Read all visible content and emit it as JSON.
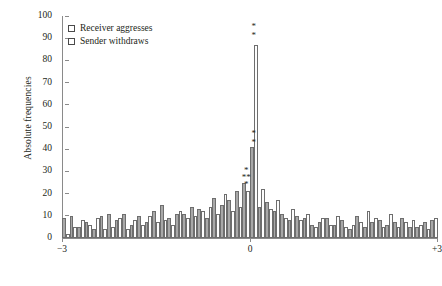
{
  "chart_data": {
    "type": "bar",
    "title": "",
    "subtitle": "",
    "xlabel": "",
    "ylabel": "Absolute frequencies",
    "ylim": [
      0,
      100
    ],
    "ytick_labels": [
      "0",
      "10",
      "20",
      "30",
      "40",
      "50",
      "60",
      "70",
      "80",
      "90",
      "100"
    ],
    "ytick_values": [
      0,
      10,
      20,
      30,
      40,
      50,
      60,
      70,
      80,
      90,
      100
    ],
    "xlim": [
      -3,
      3
    ],
    "xtick_labels": [
      "−3",
      "0",
      "+3"
    ],
    "xtick_values": [
      -3,
      0,
      3
    ],
    "grid": false,
    "legend_position": "top-left",
    "legend": [
      {
        "name": "Receiver aggresses",
        "swatch": "dark"
      },
      {
        "name": "Sender withdraws",
        "swatch": "light"
      }
    ],
    "series": [
      {
        "name": "Receiver aggresses",
        "swatch": "dark",
        "values": [
          9,
          10,
          5,
          7,
          4,
          10,
          11,
          8,
          11,
          6,
          10,
          7,
          12,
          15,
          9,
          11,
          11,
          14,
          13,
          9,
          18,
          15,
          17,
          21,
          25,
          41,
          14,
          16,
          12,
          11,
          8,
          10,
          9,
          6,
          7,
          9,
          6,
          8,
          4,
          10,
          5,
          7,
          8,
          6,
          7,
          9,
          5,
          5,
          7,
          8
        ]
      },
      {
        "name": "Sender withdraws",
        "swatch": "light",
        "values": [
          2,
          5,
          8,
          6,
          9,
          4,
          5,
          9,
          4,
          8,
          6,
          10,
          7,
          8,
          6,
          12,
          9,
          10,
          12,
          14,
          11,
          20,
          12,
          14,
          21,
          87,
          22,
          13,
          17,
          9,
          13,
          8,
          11,
          5,
          9,
          6,
          10,
          5,
          6,
          7,
          12,
          9,
          5,
          11,
          5,
          7,
          8,
          6,
          4,
          9
        ]
      }
    ],
    "annotations": [
      {
        "label": "*",
        "x_index": 24,
        "value": 30,
        "note": "significance marker above receiver bar"
      },
      {
        "label": "**",
        "x_index": 24,
        "value": 27,
        "note": "significance marker above receiver bar"
      },
      {
        "label": "*",
        "x_index": 24,
        "value": 24,
        "note": "significance marker above sender bar"
      },
      {
        "label": "*",
        "x_index": 25,
        "value": 47,
        "note": "significance marker above receiver peak"
      },
      {
        "label": "*",
        "x_index": 25,
        "value": 43,
        "note": "significance marker above receiver peak"
      },
      {
        "label": "*",
        "x_index": 25,
        "value": 95,
        "note": "significance marker above sender peak"
      },
      {
        "label": "*",
        "x_index": 25,
        "value": 91,
        "note": "significance marker above sender peak"
      }
    ]
  }
}
